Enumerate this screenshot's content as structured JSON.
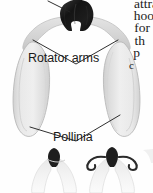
{
  "figure": {
    "background_color": "#fefefe",
    "labels": [
      {
        "id": "rotator-arms",
        "text": "Rotator arms"
      },
      {
        "id": "pollinia",
        "text": "Pollinia"
      }
    ],
    "leader_lines": [
      {
        "id": "anther-leader",
        "target": "anther"
      },
      {
        "id": "rotator-arm-leader-left",
        "target": "rotator-arm-left"
      },
      {
        "id": "rotator-arm-leader-right",
        "target": "rotator-arm-right"
      },
      {
        "id": "pollinia-leader-left",
        "target": "pollinium-left"
      },
      {
        "id": "pollinia-leader-right",
        "target": "pollinium-right"
      }
    ],
    "parts": [
      {
        "id": "anther",
        "name": "anther-cap",
        "color": "#1c1c1c"
      },
      {
        "id": "rotator-arm-left",
        "name": "rotator-arm",
        "color": "#d8d8d8"
      },
      {
        "id": "rotator-arm-right",
        "name": "rotator-arm",
        "color": "#d8d8d8"
      },
      {
        "id": "pollinium-left",
        "name": "pollinium",
        "color": "#e3e3e3"
      },
      {
        "id": "pollinium-right",
        "name": "pollinium",
        "color": "#e3e3e3"
      },
      {
        "id": "specimen-bottom-left",
        "name": "pollinarium-specimen",
        "color": "#efefef"
      },
      {
        "id": "specimen-bottom-right",
        "name": "pollinarium-specimen-curled",
        "color": "#efefef"
      }
    ]
  },
  "body_text": {
    "lines": [
      "attra",
      "hoo",
      "for",
      "th",
      "p",
      "c"
    ]
  },
  "colors": {
    "ink": "#1a1a1a",
    "anther_dark": "#1c1c1c",
    "pollinium_fill": "#e6e6e6",
    "pollinium_stroke": "#bdbdbd",
    "arm_fill": "#dcdcdc",
    "leader_line": "#222222",
    "page": "#fefefe"
  }
}
